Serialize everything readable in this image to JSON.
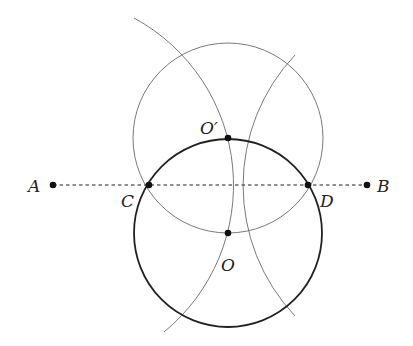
{
  "diagram": {
    "type": "geometric-construction",
    "points": {
      "A": {
        "label": "A",
        "x": 53,
        "y": 185
      },
      "B": {
        "label": "B",
        "x": 367,
        "y": 185
      },
      "C": {
        "label": "C",
        "x": 149,
        "y": 185
      },
      "D": {
        "label": "D",
        "x": 308,
        "y": 185
      },
      "O": {
        "label": "O",
        "x": 228,
        "y": 233
      },
      "O_prime": {
        "label": "O′",
        "x": 228,
        "y": 138
      }
    },
    "segments": [
      {
        "from": "A",
        "to": "B",
        "style": "dashed"
      }
    ],
    "circles": [
      {
        "center": "O",
        "radius": 94,
        "style": "bold"
      },
      {
        "center": "O_prime",
        "radius": 94,
        "style": "thin"
      }
    ],
    "arcs": [
      {
        "center_x": 44,
        "center_y": 185,
        "radius": 190,
        "style": "thin"
      },
      {
        "center_x": 412,
        "center_y": 185,
        "radius": 190,
        "style": "thin"
      }
    ],
    "colors": {
      "bold": "#222222",
      "thin": "#777777",
      "point": "#111111"
    }
  }
}
